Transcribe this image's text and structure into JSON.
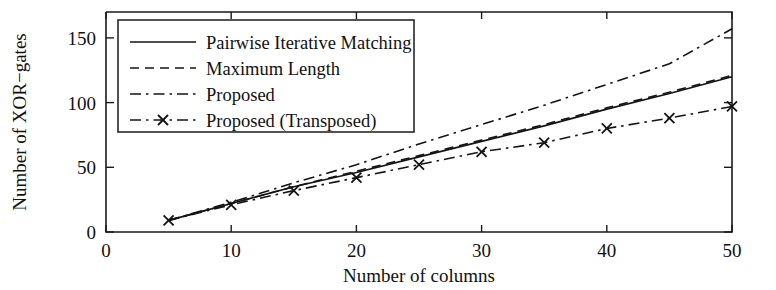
{
  "figure": {
    "title": "",
    "background": "#ffffff",
    "ink_color": "#141414"
  },
  "axes": {
    "x_title": "Number of columns",
    "y_title": "Number of XOR−gates",
    "x_ticks": [
      "0",
      "10",
      "20",
      "30",
      "40",
      "50"
    ],
    "y_ticks": [
      "0",
      "50",
      "100",
      "150"
    ]
  },
  "legend": {
    "position": "upper-left-inside",
    "entries": [
      {
        "label": "Pairwise Iterative Matching",
        "style": "solid",
        "marker": "none"
      },
      {
        "label": "Maximum Length",
        "style": "dashed",
        "marker": "none"
      },
      {
        "label": "Proposed",
        "style": "dashdot",
        "marker": "none"
      },
      {
        "label": "Proposed (Transposed)",
        "style": "dashdot",
        "marker": "x"
      }
    ]
  },
  "chart_data": {
    "type": "line",
    "title": "",
    "xlabel": "Number of columns",
    "ylabel": "Number of XOR−gates",
    "xlim": [
      0,
      50
    ],
    "ylim": [
      0,
      170
    ],
    "xticks": [
      0,
      10,
      20,
      30,
      40,
      50
    ],
    "yticks": [
      0,
      50,
      100,
      150
    ],
    "grid": false,
    "legend_position": "upper left",
    "x": [
      5,
      10,
      15,
      20,
      25,
      30,
      35,
      40,
      45,
      50
    ],
    "series": [
      {
        "name": "Pairwise Iterative Matching",
        "style": "solid",
        "marker": "none",
        "values": [
          9,
          22,
          35,
          46,
          58,
          70,
          82,
          95,
          107,
          120
        ]
      },
      {
        "name": "Maximum Length",
        "style": "dashed",
        "marker": "none",
        "values": [
          9,
          22,
          35,
          47,
          59,
          71,
          83,
          96,
          108,
          121
        ]
      },
      {
        "name": "Proposed",
        "style": "dashdot",
        "marker": "none",
        "values": [
          9,
          23,
          38,
          52,
          68,
          83,
          98,
          114,
          130,
          157
        ]
      },
      {
        "name": "Proposed (Transposed)",
        "style": "dashdot",
        "marker": "x",
        "values": [
          9,
          21,
          32,
          42,
          52,
          62,
          69,
          80,
          88,
          97
        ]
      }
    ]
  }
}
